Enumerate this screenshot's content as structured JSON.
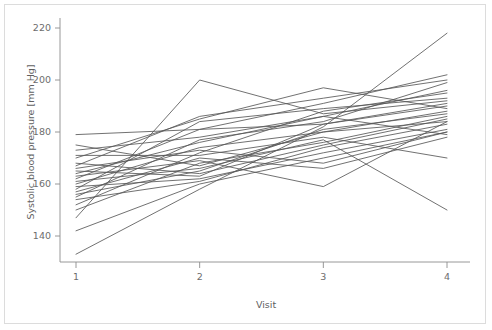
{
  "figure": {
    "background_color": "#ffffff",
    "frame_color": "#dcdcdc",
    "line_color": "#575757",
    "axis_color": "#8c8c8c",
    "text_color": "#6d6d6d"
  },
  "chart_data": {
    "type": "line",
    "title": "",
    "subtitle": "",
    "xlabel": "Visit",
    "ylabel": "Systolic blood pressure [mm Hg]",
    "x": [
      1,
      2,
      3,
      4
    ],
    "xticklabels": [
      "1",
      "2",
      "3",
      "4"
    ],
    "yticks": [
      140,
      160,
      180,
      200,
      220
    ],
    "yticklabels": [
      "140",
      "160",
      "180",
      "200",
      "220"
    ],
    "xlim": [
      0.85,
      4.15
    ],
    "ylim": [
      130,
      224
    ],
    "grid": false,
    "legend": "none",
    "categories": [
      "1",
      "2",
      "3",
      "4"
    ],
    "series": [
      {
        "name": "subject-01",
        "values": [
          179,
          181,
          183,
          190
        ]
      },
      {
        "name": "subject-02",
        "values": [
          175,
          167,
          180,
          184
        ]
      },
      {
        "name": "subject-03",
        "values": [
          173,
          178,
          186,
          196
        ]
      },
      {
        "name": "subject-04",
        "values": [
          171,
          171,
          178,
          170
        ]
      },
      {
        "name": "subject-05",
        "values": [
          170,
          185,
          197,
          189
        ]
      },
      {
        "name": "subject-06",
        "values": [
          168,
          164,
          175,
          185
        ]
      },
      {
        "name": "subject-07",
        "values": [
          167,
          186,
          193,
          200
        ]
      },
      {
        "name": "subject-08",
        "values": [
          166,
          173,
          168,
          180
        ]
      },
      {
        "name": "subject-09",
        "values": [
          165,
          163,
          183,
          191
        ]
      },
      {
        "name": "subject-10",
        "values": [
          164,
          176,
          186,
          179
        ]
      },
      {
        "name": "subject-11",
        "values": [
          163,
          169,
          159,
          184
        ]
      },
      {
        "name": "subject-12",
        "values": [
          162,
          181,
          191,
          202
        ]
      },
      {
        "name": "subject-13",
        "values": [
          161,
          166,
          177,
          150
        ]
      },
      {
        "name": "subject-14",
        "values": [
          160,
          174,
          180,
          188
        ]
      },
      {
        "name": "subject-15",
        "values": [
          159,
          162,
          172,
          181
        ]
      },
      {
        "name": "subject-16",
        "values": [
          158,
          184,
          189,
          193
        ]
      },
      {
        "name": "subject-17",
        "values": [
          157,
          170,
          166,
          178
        ]
      },
      {
        "name": "subject-18",
        "values": [
          156,
          165,
          181,
          187
        ]
      },
      {
        "name": "subject-19",
        "values": [
          155,
          177,
          184,
          199
        ]
      },
      {
        "name": "subject-20",
        "values": [
          154,
          161,
          174,
          183
        ]
      },
      {
        "name": "subject-21",
        "values": [
          152,
          172,
          188,
          195
        ]
      },
      {
        "name": "subject-22",
        "values": [
          150,
          168,
          176,
          186
        ]
      },
      {
        "name": "subject-23",
        "values": [
          147,
          200,
          187,
          192
        ]
      },
      {
        "name": "subject-24",
        "values": [
          142,
          160,
          170,
          180
        ]
      },
      {
        "name": "subject-25",
        "values": [
          133,
          158,
          182,
          218
        ]
      }
    ]
  }
}
